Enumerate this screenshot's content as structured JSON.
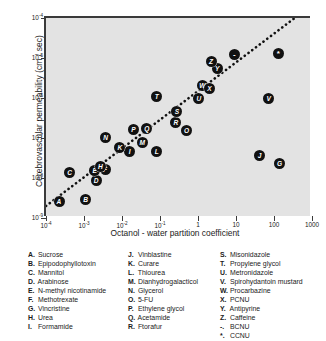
{
  "chart_data": {
    "type": "scatter",
    "title": "",
    "xlabel": "Octanol - water partition coefficient",
    "ylabel": "Cerebrovascular permeability  (cm / sec)",
    "xscale": "log",
    "yscale": "log",
    "xlim": [
      0.0001,
      1000
    ],
    "ylim": [
      1e-09,
      0.0001
    ],
    "grid": false,
    "legend_position": "below-plot",
    "xticklabels": [
      "10-4",
      "10-3",
      "10-2",
      "10-1",
      "1",
      "10",
      "100",
      "1000"
    ],
    "xtick_bases": [
      "10",
      "10",
      "10",
      "10",
      "1",
      "10",
      "100",
      "1000"
    ],
    "xtick_exponents": [
      "-4",
      "-3",
      "-2",
      "-1",
      "",
      "",
      "",
      ""
    ],
    "xtickvalues": [
      0.0001,
      0.001,
      0.01,
      0.1,
      1,
      10,
      100,
      1000
    ],
    "ytick_bases": [
      "10",
      "10",
      "10",
      "10",
      "10",
      "10"
    ],
    "ytick_exponents": [
      "-4",
      "-5",
      "-6",
      "-7",
      "-8",
      "-9"
    ],
    "ytickvalues": [
      0.0001,
      1e-05,
      1e-06,
      1e-07,
      1e-08,
      1e-09
    ],
    "trendline": {
      "style": "dotted",
      "x_start": 0.0001,
      "y_start": 2e-09,
      "x_end": 400,
      "y_end": 0.00011
    },
    "points": [
      {
        "label": "A",
        "compound": "Sucrose",
        "x": 0.00022,
        "y": 2.6e-09
      },
      {
        "label": "B",
        "compound": "Epipodophyllotoxin",
        "x": 0.0011,
        "y": 2.9e-09
      },
      {
        "label": "C",
        "compound": "Mannitol",
        "x": 0.00042,
        "y": 1.35e-08
      },
      {
        "label": "D",
        "compound": "Arabinose",
        "x": 0.0021,
        "y": 8.5e-09
      },
      {
        "label": "E",
        "compound": "N-methyl nicotinamide",
        "x": 0.0019,
        "y": 1.5e-08
      },
      {
        "label": "F",
        "compound": "Methotrexate",
        "x": 0.0036,
        "y": 1.6e-08
      },
      {
        "label": "G",
        "compound": "Vincristine",
        "x": 140.0,
        "y": 2.3e-08
      },
      {
        "label": "H",
        "compound": "Urea",
        "x": 0.0027,
        "y": 1.9e-08
      },
      {
        "label": "I",
        "compound": "Formamide",
        "x": 0.016,
        "y": 4.6e-08
      },
      {
        "label": "J",
        "compound": "Vinblastine",
        "x": 42.0,
        "y": 3.6e-08
      },
      {
        "label": "K",
        "compound": "Curare",
        "x": 0.0088,
        "y": 5.8e-08
      },
      {
        "label": "L",
        "compound": "Thiourea",
        "x": 0.082,
        "y": 4.6e-08
      },
      {
        "label": "M",
        "compound": "Dianhydrogalacticol",
        "x": 0.034,
        "y": 7.5e-08
      },
      {
        "label": "N",
        "compound": "Glycerol",
        "x": 0.0037,
        "y": 1.05e-07
      },
      {
        "label": "O",
        "compound": "5-FU",
        "x": 0.5,
        "y": 1.5e-07
      },
      {
        "label": "P",
        "compound": "Ethylene glycol",
        "x": 0.02,
        "y": 1.6e-07
      },
      {
        "label": "Q",
        "compound": "Acetamide",
        "x": 0.045,
        "y": 1.7e-07
      },
      {
        "label": "R",
        "compound": "Ftorafur",
        "x": 0.26,
        "y": 2.4e-07
      },
      {
        "label": "S",
        "compound": "Misonidazole",
        "x": 0.28,
        "y": 4.6e-07
      },
      {
        "label": "T",
        "compound": "Propylene glycol",
        "x": 0.082,
        "y": 1.1e-06
      },
      {
        "label": "U",
        "compound": "Metronidazole",
        "x": 1.05,
        "y": 1e-06
      },
      {
        "label": "V",
        "compound": "Spirohydantoin mustard",
        "x": 72.0,
        "y": 1e-06
      },
      {
        "label": "W",
        "compound": "Procarbazine",
        "x": 1.3,
        "y": 2e-06
      },
      {
        "label": "X",
        "compound": "PCNU",
        "x": 2.0,
        "y": 1.75e-06
      },
      {
        "label": "Y",
        "compound": "Antipyrine",
        "x": 3.2,
        "y": 5.5e-06
      },
      {
        "label": "Z",
        "compound": "Caffeine",
        "x": 2.2,
        "y": 8e-06
      },
      {
        "label": "-",
        "compound": "BCNU",
        "x": 9.0,
        "y": 1.25e-05
      },
      {
        "label": "*",
        "compound": "CCNU",
        "x": 130.0,
        "y": 1.3e-05
      }
    ]
  },
  "legend": {
    "columns": [
      [
        {
          "key": "A.",
          "name": "Sucrose"
        },
        {
          "key": "B.",
          "name": "Epipodophyllotoxin"
        },
        {
          "key": "C.",
          "name": "Mannitol"
        },
        {
          "key": "D.",
          "name": "Arabinose"
        },
        {
          "key": "E.",
          "name": "N-methyl nicotinamide"
        },
        {
          "key": "F.",
          "name": "Methotrexate"
        },
        {
          "key": "G.",
          "name": "Vincristine"
        },
        {
          "key": "H.",
          "name": "Urea"
        },
        {
          "key": "I.",
          "name": "Formamide"
        }
      ],
      [
        {
          "key": "J.",
          "name": "Vinblastine"
        },
        {
          "key": "K.",
          "name": "Curare"
        },
        {
          "key": "L.",
          "name": "Thiourea"
        },
        {
          "key": "M.",
          "name": "Dianhydrogalacticol"
        },
        {
          "key": "N.",
          "name": "Glycerol"
        },
        {
          "key": "O.",
          "name": "5-FU"
        },
        {
          "key": "P.",
          "name": "Ethylene glycol"
        },
        {
          "key": "Q.",
          "name": "Acetamide"
        },
        {
          "key": "R.",
          "name": "Ftorafur"
        }
      ],
      [
        {
          "key": "S.",
          "name": "Misonidazole"
        },
        {
          "key": "T.",
          "name": "Propylene glycol"
        },
        {
          "key": "U.",
          "name": "Metronidazole"
        },
        {
          "key": "V.",
          "name": "Spirohydantoin mustard"
        },
        {
          "key": "W.",
          "name": "Procarbazine"
        },
        {
          "key": "X.",
          "name": "PCNU"
        },
        {
          "key": "Y.",
          "name": "Antipyrine"
        },
        {
          "key": "Z.",
          "name": "Caffeine"
        },
        {
          "key": "-.",
          "name": "BCNU"
        },
        {
          "key": "*.",
          "name": "CCNU"
        }
      ]
    ]
  },
  "colors": {
    "plot_background": "#e3e3e3",
    "axis": "#3a3a3a",
    "marker": "#111111",
    "marker_text": "#ffffff",
    "page_background": "#ffffff"
  }
}
